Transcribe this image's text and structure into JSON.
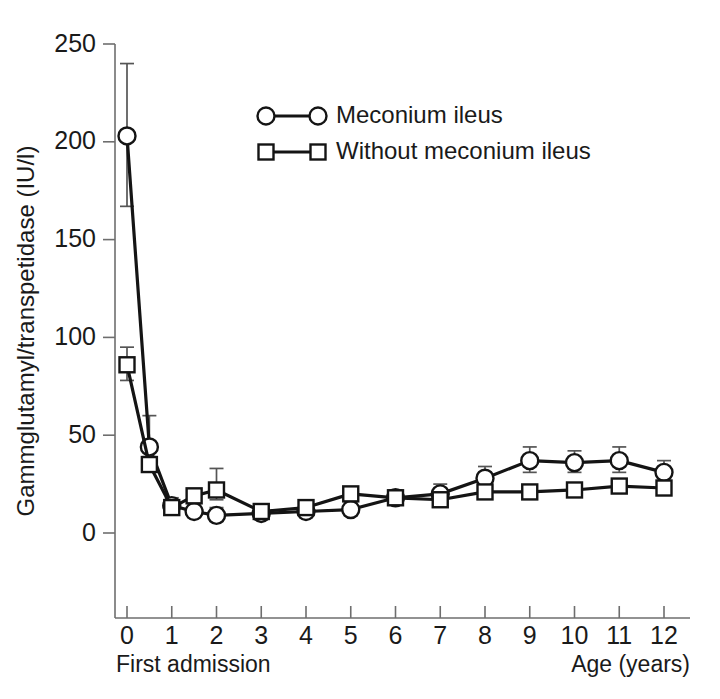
{
  "chart_data": {
    "type": "line",
    "title": "",
    "xlabel": "Age (years)",
    "ylabel": "Gammglutamyl/transpetidase (IU/l)",
    "x_origin_label": "First admission",
    "xlim": [
      -0.35,
      12.55
    ],
    "ylim": [
      0,
      250
    ],
    "xticks": [
      0,
      1,
      2,
      3,
      4,
      5,
      6,
      7,
      8,
      9,
      10,
      11,
      12
    ],
    "xticklabels": [
      "0",
      "1",
      "2",
      "3",
      "4",
      "5",
      "6",
      "7",
      "8",
      "9",
      "10",
      "11",
      "12"
    ],
    "yticks": [
      0,
      50,
      100,
      150,
      200,
      250
    ],
    "yticklabels": [
      "0",
      "50",
      "100",
      "150",
      "200",
      "250"
    ],
    "grid": false,
    "legend_position": "upper center",
    "error_bars": "mean +/- SEM",
    "marker_colors": {
      "face": "#ffffff",
      "edge": "#141414"
    },
    "line_color": "#141414",
    "axis_color": "#6e6e6e",
    "series": [
      {
        "name": "Meconium ileus",
        "marker": "circle",
        "x": [
          0,
          0.5,
          1,
          1.5,
          2,
          3,
          4,
          5,
          6,
          7,
          8,
          9,
          10,
          11,
          12
        ],
        "values": [
          203,
          44,
          14,
          11,
          9,
          10,
          11,
          12,
          18,
          20,
          28,
          37,
          36,
          37,
          31
        ],
        "err_low": [
          167,
          38,
          11,
          8,
          6,
          7,
          8,
          9,
          15,
          16,
          23,
          31,
          31,
          31,
          26
        ],
        "err_high": [
          240,
          60,
          18,
          15,
          13,
          14,
          15,
          16,
          22,
          25,
          34,
          44,
          42,
          44,
          37
        ]
      },
      {
        "name": "Without meconium ileus",
        "marker": "square",
        "x": [
          0,
          0.5,
          1,
          1.5,
          2,
          3,
          4,
          5,
          6,
          7,
          8,
          9,
          10,
          11,
          12
        ],
        "values": [
          86,
          35,
          13,
          19,
          22,
          11,
          13,
          20,
          18,
          17,
          21,
          21,
          22,
          24,
          23
        ],
        "err_low": [
          78,
          32,
          11,
          17,
          17,
          9,
          11,
          18,
          16,
          15,
          19,
          19,
          20,
          22,
          21
        ],
        "err_high": [
          95,
          39,
          16,
          22,
          33,
          13,
          15,
          23,
          21,
          20,
          24,
          24,
          25,
          27,
          26
        ]
      }
    ]
  },
  "legend": {
    "items": [
      {
        "label": "Meconium ileus",
        "marker": "circle"
      },
      {
        "label": "Without meconium ileus",
        "marker": "square"
      }
    ]
  }
}
